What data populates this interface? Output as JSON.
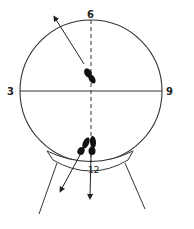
{
  "diagram": {
    "type": "clock-position diagram",
    "labels": {
      "top": "6",
      "left": "3",
      "right": "9",
      "bottom": "12"
    },
    "elements": [
      {
        "name": "circle",
        "description": "large circle (clock face)"
      },
      {
        "name": "horizontal-axis",
        "description": "solid line from 3 to 9"
      },
      {
        "name": "vertical-axis",
        "description": "dashed line from 6 to 12"
      },
      {
        "name": "footprint-center",
        "description": "single dark footprint near center with arrow pointing up-left past circle"
      },
      {
        "name": "footprints-bottom",
        "description": "pair of dark footprints near 12 with arrows pointing down and down-left"
      },
      {
        "name": "curved-base",
        "description": "curved band labeled 12 beneath circle"
      },
      {
        "name": "legs",
        "description": "two diverging lines extending downward from base"
      }
    ],
    "colors": {
      "stroke": "#333333",
      "fill": "#111111",
      "background": "#ffffff"
    }
  }
}
